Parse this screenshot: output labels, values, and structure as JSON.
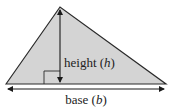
{
  "diagram": {
    "shape": "triangle",
    "colors": {
      "fill": "#d4d4d4",
      "stroke": "#2a2a2a",
      "background": "#ffffff"
    },
    "labels": {
      "height": {
        "word": "height",
        "open": "(",
        "symbol": "h",
        "close": ")"
      },
      "base": {
        "word": "base",
        "open": "(",
        "symbol": "b",
        "close": ")"
      }
    },
    "markers": {
      "right_angle": "right-angle-square",
      "height_arrow": "down-arrow",
      "base_arrow": "double-headed-arrow"
    }
  }
}
